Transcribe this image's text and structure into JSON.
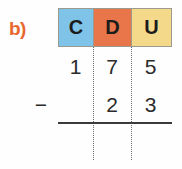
{
  "exercise": {
    "label": "b)",
    "label_color": "#e8672e"
  },
  "colors": {
    "hundreds_cell": "#7fc3e8",
    "tens_cell": "#e8764a",
    "units_cell": "#f5d98a",
    "rule_line": "#3a3a3a",
    "divider": "#6b6b6b",
    "digit_text": "#2b2b2b",
    "header_text": "#1c1c1c",
    "background": "#fefefe"
  },
  "columns": {
    "headers": [
      "C",
      "D",
      "U"
    ]
  },
  "problem": {
    "operator": "−",
    "minuend": {
      "C": "1",
      "D": "7",
      "U": "5"
    },
    "subtrahend": {
      "C": "",
      "D": "2",
      "U": "3"
    },
    "result": {
      "C": "",
      "D": "",
      "U": ""
    }
  }
}
